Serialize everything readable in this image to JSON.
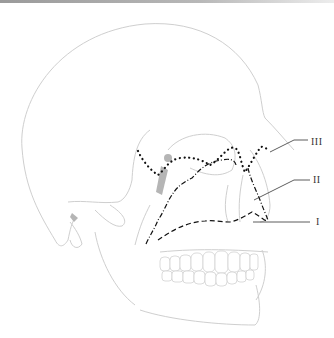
{
  "figure": {
    "labels": [
      {
        "id": "le-fort-3",
        "text": "III",
        "x": 311,
        "y": 142
      },
      {
        "id": "le-fort-2",
        "text": "II",
        "x": 313,
        "y": 175
      },
      {
        "id": "le-fort-1",
        "text": "I",
        "x": 314,
        "y": 218
      }
    ],
    "colors": {
      "outline": "#cfcfcf",
      "fracture": "#111111",
      "leader": "#333333",
      "shade": "#b5b5b5"
    }
  }
}
